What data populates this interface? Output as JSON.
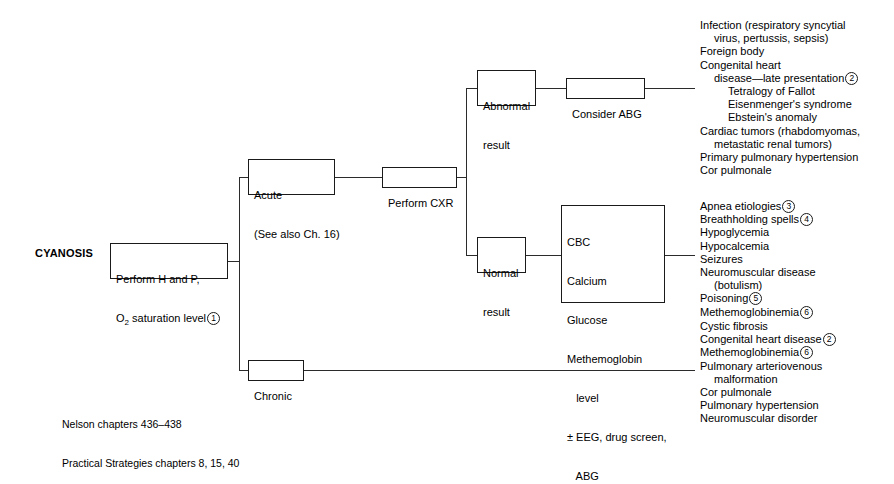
{
  "diagram": {
    "title": "CYANOSIS",
    "root_box": {
      "line1": "Perform H and P,",
      "line2_pre": "O",
      "line2_sub": "2",
      "line2_post": " saturation level",
      "ref": "1"
    },
    "branches": {
      "acute": {
        "line1": "Acute",
        "line2": "(See also Ch. 16)"
      },
      "chronic": {
        "label": "Chronic"
      },
      "perform_cxr": {
        "label": "Perform CXR"
      },
      "abnormal_result": {
        "line1": "Abnormal",
        "line2": "result"
      },
      "normal_result": {
        "line1": "Normal",
        "line2": "result"
      },
      "consider_abg": {
        "label": "Consider ABG"
      }
    },
    "labs_box": {
      "items": [
        "CBC",
        "Calcium",
        "Glucose",
        "Methemoglobin",
        "   level",
        "± EEG, drug screen,",
        "   ABG"
      ]
    },
    "abnormal_list": [
      {
        "text": "Infection (respiratory syncytial",
        "indent": 0,
        "ref": ""
      },
      {
        "text": "virus, pertussis, sepsis)",
        "indent": 1,
        "ref": ""
      },
      {
        "text": "Foreign body",
        "indent": 0,
        "ref": ""
      },
      {
        "text": "Congenital heart",
        "indent": 0,
        "ref": ""
      },
      {
        "text": "disease—late presentation",
        "indent": 1,
        "ref": "2"
      },
      {
        "text": "Tetralogy of Fallot",
        "indent": 2,
        "ref": ""
      },
      {
        "text": "Eisenmenger's syndrome",
        "indent": 2,
        "ref": ""
      },
      {
        "text": "Ebstein's anomaly",
        "indent": 2,
        "ref": ""
      },
      {
        "text": "Cardiac tumors (rhabdomyomas,",
        "indent": 0,
        "ref": ""
      },
      {
        "text": "metastatic renal tumors)",
        "indent": 1,
        "ref": ""
      },
      {
        "text": "Primary pulmonary hypertension",
        "indent": 0,
        "ref": ""
      },
      {
        "text": "Cor pulmonale",
        "indent": 0,
        "ref": ""
      }
    ],
    "normal_list": [
      {
        "text": "Apnea etiologies",
        "indent": 0,
        "ref": "3"
      },
      {
        "text": "Breathholding spells",
        "indent": 0,
        "ref": "4"
      },
      {
        "text": "Hypoglycemia",
        "indent": 0,
        "ref": ""
      },
      {
        "text": "Hypocalcemia",
        "indent": 0,
        "ref": ""
      },
      {
        "text": "Seizures",
        "indent": 0,
        "ref": ""
      },
      {
        "text": "Neuromuscular disease",
        "indent": 0,
        "ref": ""
      },
      {
        "text": "(botulism)",
        "indent": 1,
        "ref": ""
      },
      {
        "text": "Poisoning",
        "indent": 0,
        "ref": "5"
      },
      {
        "text": "Methemoglobinemia",
        "indent": 0,
        "ref": "6"
      }
    ],
    "chronic_list": [
      {
        "text": "Cystic fibrosis",
        "indent": 0,
        "ref": ""
      },
      {
        "text": "Congenital heart disease",
        "indent": 0,
        "ref": "2"
      },
      {
        "text": "Methemoglobinemia",
        "indent": 0,
        "ref": "6"
      },
      {
        "text": "Pulmonary arteriovenous",
        "indent": 0,
        "ref": ""
      },
      {
        "text": "malformation",
        "indent": 1,
        "ref": ""
      },
      {
        "text": "Cor pulmonale",
        "indent": 0,
        "ref": ""
      },
      {
        "text": "Pulmonary hypertension",
        "indent": 0,
        "ref": ""
      },
      {
        "text": "Neuromuscular disorder",
        "indent": 0,
        "ref": ""
      }
    ],
    "footnotes": [
      "Nelson chapters 436–438",
      "Practical Strategies chapters 8, 15, 40"
    ],
    "colors": {
      "ink": "#1a1a1a",
      "line": "#2b2b2b",
      "background": "#ffffff"
    }
  }
}
